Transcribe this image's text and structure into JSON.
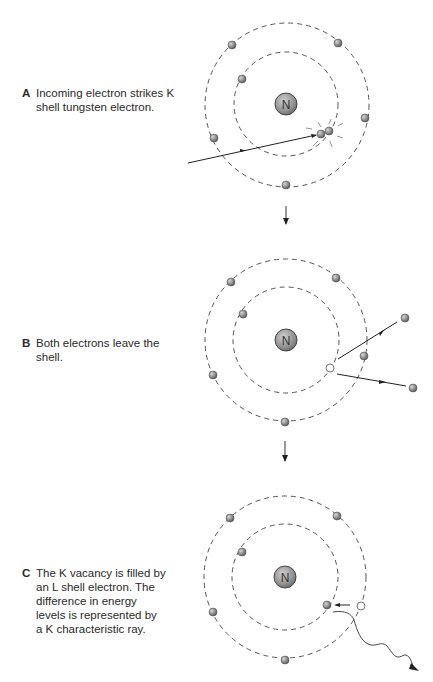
{
  "panels": [
    {
      "letter": "A",
      "lines": [
        "Incoming electron strikes K",
        "shell tungsten electron."
      ],
      "nucleus_label": "N"
    },
    {
      "letter": "B",
      "lines": [
        "Both electrons leave the",
        "shell."
      ],
      "nucleus_label": "N"
    },
    {
      "letter": "C",
      "lines": [
        "The K vacancy is filled by",
        "an L shell electron. The",
        "difference in energy",
        "levels is represented by",
        "a K characteristic ray."
      ],
      "nucleus_label": "N"
    }
  ],
  "colors": {
    "orbit": "#555555",
    "electron": "#8a8a8a",
    "nucleus": "#9a9a9a",
    "line": "#333333"
  }
}
